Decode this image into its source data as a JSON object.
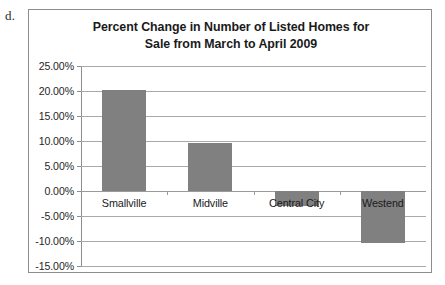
{
  "item_label": "d.",
  "chart_data": {
    "type": "bar",
    "title": "Percent Change in Number of Listed Homes for Sale from March to April 2009",
    "title_line1": "Percent Change in Number of Listed Homes for",
    "title_line2": "Sale from March to April 2009",
    "xlabel": "",
    "ylabel": "",
    "categories": [
      "Smallville",
      "Midville",
      "Central City",
      "Westend"
    ],
    "values": [
      20.2,
      9.7,
      -3.0,
      -10.3
    ],
    "value_labels": [
      "20.20%",
      "9.70%",
      "-3.00%",
      "-10.30%"
    ],
    "ylim": [
      -15,
      25
    ],
    "ytick_values": [
      25,
      20,
      15,
      10,
      5,
      0,
      -5,
      -10,
      -15
    ],
    "ytick_labels": [
      "25.00%",
      "20.00%",
      "15.00%",
      "10.00%",
      "5.00%",
      "0.00%",
      "-5.00%",
      "-10.00%",
      "-15.00%"
    ],
    "grid": true,
    "legend": false,
    "bar_color": "#808080",
    "gridline_color": "#a9a9a9",
    "axis_color": "#8d8d8d",
    "plot_background": "#ffffff"
  }
}
